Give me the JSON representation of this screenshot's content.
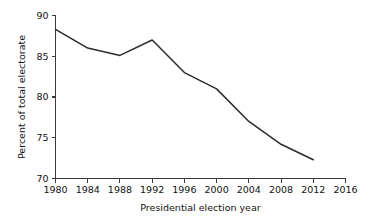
{
  "chart_data": {
    "type": "line",
    "title": "",
    "subtitle": "",
    "xlabel": "Presidential election year",
    "ylabel": "Percent of total electorate",
    "x": [
      1980,
      1984,
      1988,
      1992,
      1996,
      2000,
      2004,
      2008,
      2012
    ],
    "values": [
      88.3,
      86.0,
      85.1,
      87.0,
      83.0,
      81.0,
      77.0,
      74.2,
      72.3
    ],
    "series": [
      {
        "name": "Percent of total electorate",
        "x": [
          1980,
          1984,
          1988,
          1992,
          1996,
          2000,
          2004,
          2008,
          2012
        ],
        "values": [
          88.3,
          86.0,
          85.1,
          87.0,
          83.0,
          81.0,
          77.0,
          74.2,
          72.3
        ]
      }
    ],
    "xlim": [
      1980,
      2016
    ],
    "ylim": [
      70,
      90
    ],
    "xticks": [
      1980,
      1984,
      1988,
      1992,
      1996,
      2000,
      2004,
      2008,
      2012,
      2016
    ],
    "xtick_labels": [
      "1980",
      "1984",
      "1988",
      "1992",
      "1996",
      "2000",
      "2004",
      "2008",
      "2012",
      "2016"
    ],
    "yticks": [
      70,
      75,
      80,
      85,
      90
    ],
    "ytick_labels": [
      "70",
      "75",
      "80",
      "85",
      "90"
    ],
    "grid": false,
    "legend": false,
    "legend_position": "none",
    "line_color": "#2b2b2b",
    "axis_color": "#3a3a3a",
    "background_color": "#ffffff",
    "annotations": []
  },
  "axes": {
    "x_title": "Presidential election year",
    "y_title": "Percent of total electorate"
  }
}
